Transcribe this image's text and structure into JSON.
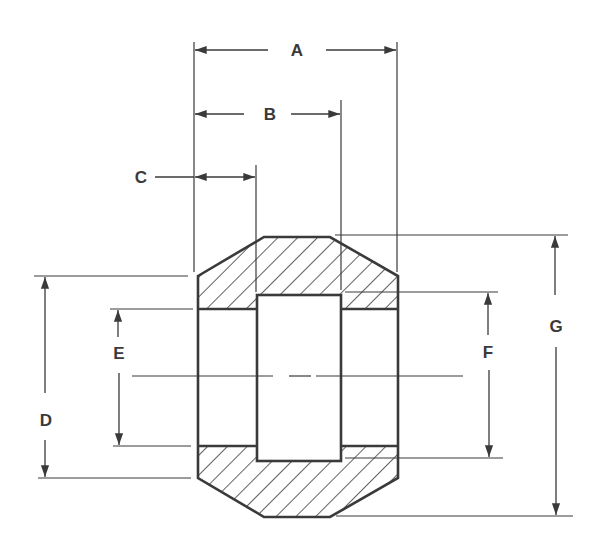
{
  "diagram": {
    "type": "engineering-cross-section",
    "colors": {
      "line": "#3a3a3a",
      "hatch": "#3a3a3a",
      "background": "#ffffff"
    },
    "labels": {
      "A": "A",
      "B": "B",
      "C": "C",
      "D": "D",
      "E": "E",
      "F": "F",
      "G": "G"
    },
    "dimensions": [
      {
        "id": "A",
        "orientation": "horizontal",
        "description": "overall length"
      },
      {
        "id": "B",
        "orientation": "horizontal",
        "description": "left face to right socket bottom"
      },
      {
        "id": "C",
        "orientation": "horizontal",
        "description": "socket depth"
      },
      {
        "id": "D",
        "orientation": "vertical",
        "description": "outer diameter at ends"
      },
      {
        "id": "E",
        "orientation": "vertical",
        "description": "socket bore diameter"
      },
      {
        "id": "F",
        "orientation": "vertical",
        "description": "inner bore diameter"
      },
      {
        "id": "G",
        "orientation": "vertical",
        "description": "outer body diameter"
      }
    ]
  }
}
